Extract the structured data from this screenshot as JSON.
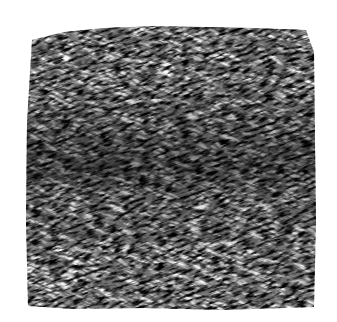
{
  "image": {
    "subject": "grass-fur-texture",
    "background_color": "#ffffff",
    "texture": {
      "tone": "grayscale",
      "dark_color": "#1a1a1a",
      "light_color": "#ffffff",
      "stroke_direction": "diagonal",
      "dark_band": "center-left horizontal band"
    }
  }
}
